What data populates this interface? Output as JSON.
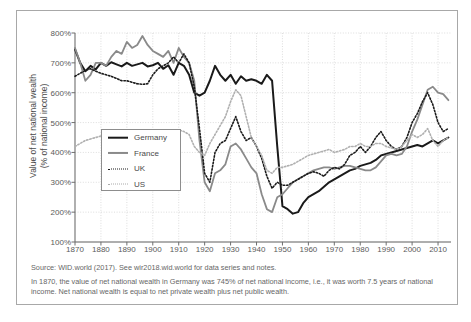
{
  "axes": {
    "ylabel_line1": "Value of net national wealth",
    "ylabel_line2": "(% of national income)",
    "yticks": [
      "800%",
      "700%",
      "600%",
      "500%",
      "400%",
      "300%",
      "200%",
      "100%"
    ],
    "xticks": [
      "1870",
      "1880",
      "1890",
      "1900",
      "1910",
      "1920",
      "1930",
      "1940",
      "1950",
      "1960",
      "1970",
      "1980",
      "1990",
      "2000",
      "2010"
    ]
  },
  "legend": {
    "items": [
      {
        "label": "Germany",
        "icon": "solid-thick-black-line-icon",
        "color": "#1a1a1a",
        "style": "solid"
      },
      {
        "label": "France",
        "icon": "solid-gray-line-icon",
        "color": "#8a8a8a",
        "style": "solid"
      },
      {
        "label": "UK",
        "icon": "dotted-black-line-icon",
        "color": "#1a1a1a",
        "style": "dotted"
      },
      {
        "label": "US",
        "icon": "dotted-light-gray-line-icon",
        "color": "#aaaaaa",
        "style": "dotted"
      }
    ]
  },
  "footer": {
    "source": "Source: WID.world (2017). See wir2018.wid.world for data series and notes.",
    "note": "In 1870, the value of net national wealth in Germany was 745% of net national income, i.e., it was worth 7.5 years of national income. Net national wealth is equal to net private wealth plus net public wealth."
  },
  "chart_data": {
    "type": "line",
    "title": "",
    "xlabel": "",
    "ylabel": "Value of net national wealth (% of national income)",
    "xlim": [
      1870,
      2015
    ],
    "ylim": [
      100,
      800
    ],
    "ytick_step": 100,
    "xtick_step": 10,
    "grid": true,
    "legend_position": "inside-left-middle",
    "series": [
      {
        "name": "Germany",
        "color": "#1a1a1a",
        "style": "solid",
        "width": 2.0,
        "x": [
          1870,
          1872,
          1874,
          1876,
          1878,
          1880,
          1882,
          1884,
          1886,
          1888,
          1890,
          1892,
          1894,
          1896,
          1898,
          1900,
          1902,
          1904,
          1906,
          1908,
          1910,
          1912,
          1914,
          1916,
          1918,
          1920,
          1922,
          1924,
          1926,
          1928,
          1930,
          1932,
          1934,
          1936,
          1938,
          1940,
          1942,
          1944,
          1946,
          1948,
          1950,
          1952,
          1954,
          1956,
          1958,
          1960,
          1962,
          1964,
          1966,
          1968,
          1970,
          1972,
          1974,
          1976,
          1978,
          1980,
          1982,
          1984,
          1986,
          1988,
          1990,
          1992,
          1994,
          1996,
          1998,
          2000,
          2002,
          2004,
          2006,
          2008,
          2010,
          2012,
          2014
        ],
        "y": [
          745,
          700,
          672,
          690,
          678,
          700,
          690,
          702,
          695,
          688,
          700,
          690,
          695,
          700,
          688,
          692,
          700,
          680,
          692,
          660,
          700,
          690,
          660,
          600,
          590,
          600,
          640,
          690,
          660,
          640,
          660,
          630,
          655,
          640,
          645,
          640,
          630,
          660,
          640,
          420,
          220,
          210,
          195,
          200,
          230,
          250,
          260,
          270,
          285,
          300,
          310,
          320,
          330,
          340,
          345,
          355,
          360,
          365,
          375,
          390,
          395,
          400,
          405,
          410,
          415,
          420,
          425,
          420,
          430,
          440,
          430,
          440,
          450
        ]
      },
      {
        "name": "France",
        "color": "#8a8a8a",
        "style": "solid",
        "width": 1.8,
        "x": [
          1870,
          1872,
          1874,
          1876,
          1878,
          1880,
          1882,
          1884,
          1886,
          1888,
          1890,
          1892,
          1894,
          1896,
          1898,
          1900,
          1902,
          1904,
          1906,
          1908,
          1910,
          1912,
          1914,
          1916,
          1918,
          1920,
          1922,
          1924,
          1926,
          1928,
          1930,
          1932,
          1934,
          1936,
          1938,
          1940,
          1942,
          1944,
          1946,
          1948,
          1950,
          1952,
          1954,
          1956,
          1958,
          1960,
          1962,
          1964,
          1966,
          1968,
          1970,
          1972,
          1974,
          1976,
          1978,
          1980,
          1982,
          1984,
          1986,
          1988,
          1990,
          1992,
          1994,
          1996,
          1998,
          2000,
          2002,
          2004,
          2006,
          2008,
          2010,
          2012,
          2014
        ],
        "y": [
          750,
          700,
          640,
          660,
          700,
          700,
          690,
          720,
          740,
          730,
          770,
          750,
          760,
          790,
          760,
          740,
          730,
          720,
          740,
          700,
          750,
          720,
          700,
          640,
          440,
          300,
          270,
          330,
          340,
          360,
          420,
          430,
          410,
          380,
          350,
          330,
          260,
          210,
          200,
          250,
          260,
          280,
          300,
          310,
          320,
          330,
          340,
          345,
          350,
          350,
          345,
          350,
          355,
          355,
          350,
          345,
          340,
          340,
          350,
          370,
          390,
          395,
          390,
          395,
          420,
          470,
          510,
          560,
          610,
          620,
          600,
          595,
          575
        ]
      },
      {
        "name": "UK",
        "color": "#1a1a1a",
        "style": "dotted",
        "width": 1.6,
        "x": [
          1870,
          1872,
          1874,
          1876,
          1878,
          1880,
          1882,
          1884,
          1886,
          1888,
          1890,
          1892,
          1894,
          1896,
          1898,
          1900,
          1902,
          1904,
          1906,
          1908,
          1910,
          1912,
          1914,
          1916,
          1918,
          1920,
          1922,
          1924,
          1926,
          1928,
          1930,
          1932,
          1934,
          1936,
          1938,
          1940,
          1942,
          1944,
          1946,
          1948,
          1950,
          1952,
          1954,
          1956,
          1958,
          1960,
          1962,
          1964,
          1966,
          1968,
          1970,
          1972,
          1974,
          1976,
          1978,
          1980,
          1982,
          1984,
          1986,
          1988,
          1990,
          1992,
          1994,
          1996,
          1998,
          2000,
          2002,
          2004,
          2006,
          2008,
          2010,
          2012,
          2014
        ],
        "y": [
          655,
          665,
          675,
          680,
          672,
          665,
          660,
          655,
          648,
          640,
          640,
          635,
          630,
          628,
          630,
          660,
          680,
          690,
          700,
          720,
          700,
          730,
          700,
          620,
          480,
          330,
          300,
          400,
          430,
          440,
          480,
          520,
          470,
          440,
          450,
          420,
          380,
          320,
          280,
          300,
          290,
          290,
          300,
          310,
          320,
          330,
          335,
          330,
          320,
          340,
          350,
          345,
          360,
          390,
          400,
          420,
          400,
          420,
          450,
          470,
          440,
          420,
          410,
          420,
          450,
          500,
          530,
          570,
          600,
          560,
          500,
          470,
          480
        ]
      },
      {
        "name": "US",
        "color": "#b0b0b0",
        "style": "dotted",
        "width": 1.6,
        "x": [
          1870,
          1872,
          1874,
          1876,
          1878,
          1880,
          1882,
          1884,
          1886,
          1888,
          1890,
          1892,
          1894,
          1896,
          1898,
          1900,
          1902,
          1904,
          1906,
          1908,
          1910,
          1912,
          1914,
          1916,
          1918,
          1920,
          1922,
          1924,
          1926,
          1928,
          1930,
          1932,
          1934,
          1936,
          1938,
          1940,
          1942,
          1944,
          1946,
          1948,
          1950,
          1952,
          1954,
          1956,
          1958,
          1960,
          1962,
          1964,
          1966,
          1968,
          1970,
          1972,
          1974,
          1976,
          1978,
          1980,
          1982,
          1984,
          1986,
          1988,
          1990,
          1992,
          1994,
          1996,
          1998,
          2000,
          2002,
          2004,
          2006,
          2008,
          2010,
          2012,
          2014
        ],
        "y": [
          420,
          430,
          440,
          445,
          450,
          455,
          450,
          455,
          460,
          465,
          470,
          465,
          460,
          462,
          465,
          470,
          468,
          470,
          472,
          470,
          475,
          470,
          460,
          420,
          400,
          390,
          430,
          460,
          490,
          520,
          570,
          610,
          590,
          520,
          450,
          420,
          390,
          340,
          330,
          350,
          350,
          355,
          360,
          370,
          380,
          390,
          395,
          400,
          405,
          410,
          400,
          405,
          410,
          420,
          420,
          430,
          420,
          420,
          430,
          430,
          420,
          415,
          410,
          420,
          440,
          460,
          450,
          460,
          480,
          440,
          420,
          440,
          450
        ]
      }
    ]
  }
}
